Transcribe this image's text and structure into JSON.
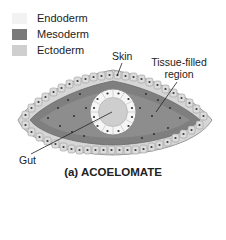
{
  "legend": {
    "items": [
      {
        "label": "Endoderm",
        "color": "#f2f2f2"
      },
      {
        "label": "Mesoderm",
        "color": "#7a7a7a"
      },
      {
        "label": "Ectoderm",
        "color": "#cfcfcf"
      }
    ]
  },
  "labels": {
    "skin": "Skin",
    "tissue_line1": "Tissue-filled",
    "tissue_line2": "region",
    "gut": "Gut"
  },
  "caption": "(a) ACOELOMATE",
  "colors": {
    "ectoderm_cell": "#d4d4d4",
    "ectoderm_border": "#9a9a9a",
    "mesoderm": "#7d7d7d",
    "mesoderm_light": "#a3a3a3",
    "endoderm_cell": "#f4f4f4",
    "gut_lumen": "#cdcdcd",
    "nucleus": "#333333"
  }
}
